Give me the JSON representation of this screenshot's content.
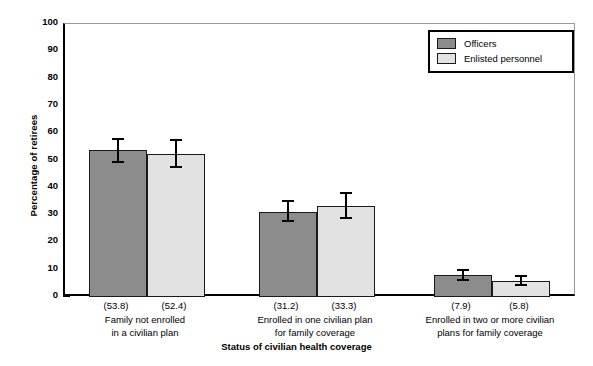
{
  "chart_data": {
    "type": "bar",
    "title": "",
    "xlabel": "Status of civilian health coverage",
    "ylabel": "Percentage of retirees",
    "ylim": [
      0,
      100
    ],
    "ytick_step": 10,
    "yticks": [
      "100",
      "90",
      "80",
      "70",
      "60",
      "50",
      "40",
      "30",
      "20",
      "10",
      "0"
    ],
    "grid": false,
    "legend_position": "top-right",
    "categories": [
      "Family not enrolled in a civilian plan",
      "Enrolled in one civilian plan for family coverage",
      "Enrolled in two or more civilian plans for family coverage"
    ],
    "series": [
      {
        "name": "Officers",
        "color": "#8c8c8c",
        "values": [
          53.8,
          31.2,
          7.9
        ],
        "errors_low": [
          48.9,
          27.6,
          5.8
        ],
        "errors_high": [
          58.3,
          35.5,
          10.4
        ]
      },
      {
        "name": "Enlisted personnel",
        "color": "#e2e2e2",
        "values": [
          52.4,
          33.3,
          5.8
        ],
        "errors_low": [
          47.2,
          28.6,
          4.1
        ],
        "errors_high": [
          58.0,
          38.6,
          8.0
        ]
      }
    ],
    "value_labels": [
      "(53.8)",
      "(52.4)",
      "(31.2)",
      "(33.3)",
      "(7.9)",
      "(5.8)"
    ]
  },
  "axes": {
    "y_title": "Percentage of retirees",
    "x_title": "Status of civilian health coverage",
    "ticks": [
      {
        "label": "100"
      },
      {
        "label": "90"
      },
      {
        "label": "80"
      },
      {
        "label": "70"
      },
      {
        "label": "60"
      },
      {
        "label": "50"
      },
      {
        "label": "40"
      },
      {
        "label": "30"
      },
      {
        "label": "20"
      },
      {
        "label": "10"
      },
      {
        "label": "0"
      }
    ]
  },
  "legend": {
    "items": [
      {
        "label": "Officers",
        "swatch": "officers"
      },
      {
        "label": "Enlisted personnel",
        "swatch": "enlisted"
      }
    ]
  },
  "groups": [
    {
      "caption_line1": "Family not enrolled",
      "caption_line2": "in a civilian plan",
      "bars": [
        {
          "series": "Officers",
          "value_label": "(53.8)"
        },
        {
          "series": "Enlisted personnel",
          "value_label": "(52.4)"
        }
      ]
    },
    {
      "caption_line1": "Enrolled in one civilian plan",
      "caption_line2": "for family coverage",
      "bars": [
        {
          "series": "Officers",
          "value_label": "(31.2)"
        },
        {
          "series": "Enlisted personnel",
          "value_label": "(33.3)"
        }
      ]
    },
    {
      "caption_line1": "Enrolled in two or more civilian",
      "caption_line2": "plans for family coverage",
      "bars": [
        {
          "series": "Officers",
          "value_label": "(7.9)"
        },
        {
          "series": "Enlisted personnel",
          "value_label": "(5.8)"
        }
      ]
    }
  ]
}
